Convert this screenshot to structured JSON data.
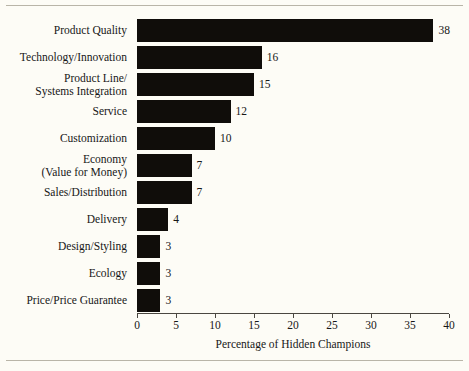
{
  "figure": {
    "background_color": "#fdfcf6",
    "bar_color": "#100d0a",
    "axis_color": "#4a4741",
    "rule_color": "#b9b5a8"
  },
  "chart_data": {
    "type": "bar",
    "orientation": "horizontal",
    "title": "",
    "xlabel": "Percentage of Hidden Champions",
    "ylabel": "",
    "xlim": [
      0,
      40
    ],
    "xticks": [
      0,
      5,
      10,
      15,
      20,
      25,
      30,
      35,
      40
    ],
    "xtick_labels": [
      "0",
      "5",
      "10",
      "15",
      "20",
      "25",
      "30",
      "35",
      "40"
    ],
    "grid": false,
    "legend": null,
    "categories": [
      "Product Quality",
      "Technology/Innovation",
      "Product Line/ Systems Integration",
      "Service",
      "Customization",
      "Economy (Value for Money)",
      "Sales/Distribution",
      "Delivery",
      "Design/Styling",
      "Ecology",
      "Price/Price Guarantee"
    ],
    "values": [
      38,
      16,
      15,
      12,
      10,
      7,
      7,
      4,
      3,
      3,
      3
    ],
    "data_labels": [
      "38",
      "16",
      "15",
      "12",
      "10",
      "7",
      "7",
      "4",
      "3",
      "3",
      "3"
    ]
  },
  "rows": [
    {
      "label_lines": [
        "Product Quality"
      ],
      "value": 38,
      "value_label": "38"
    },
    {
      "label_lines": [
        "Technology/Innovation"
      ],
      "value": 16,
      "value_label": "16"
    },
    {
      "label_lines": [
        "Product Line/",
        "Systems Integration"
      ],
      "value": 15,
      "value_label": "15"
    },
    {
      "label_lines": [
        "Service"
      ],
      "value": 12,
      "value_label": "12"
    },
    {
      "label_lines": [
        "Customization"
      ],
      "value": 10,
      "value_label": "10"
    },
    {
      "label_lines": [
        "Economy",
        "(Value for Money)"
      ],
      "value": 7,
      "value_label": "7"
    },
    {
      "label_lines": [
        "Sales/Distribution"
      ],
      "value": 7,
      "value_label": "7"
    },
    {
      "label_lines": [
        "Delivery"
      ],
      "value": 4,
      "value_label": "4"
    },
    {
      "label_lines": [
        "Design/Styling"
      ],
      "value": 3,
      "value_label": "3"
    },
    {
      "label_lines": [
        "Ecology"
      ],
      "value": 3,
      "value_label": "3"
    },
    {
      "label_lines": [
        "Price/Price Guarantee"
      ],
      "value": 3,
      "value_label": "3"
    }
  ],
  "axis": {
    "title": "Percentage of Hidden Champions",
    "ticks": [
      "0",
      "5",
      "10",
      "15",
      "20",
      "25",
      "30",
      "35",
      "40"
    ]
  }
}
